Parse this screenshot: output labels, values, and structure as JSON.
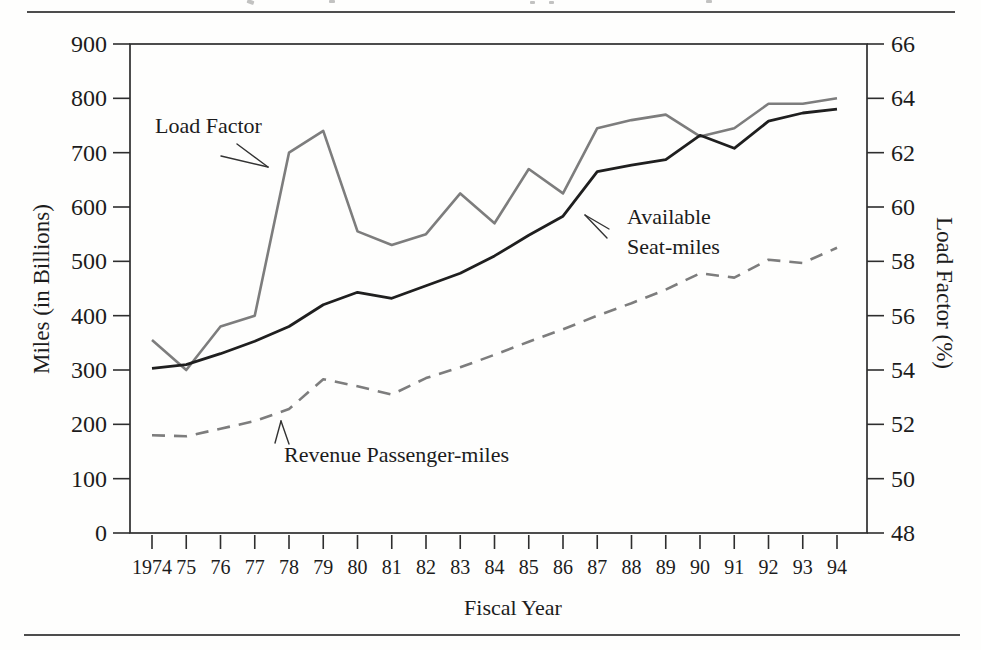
{
  "colors": {
    "gray": "#7d7d7d",
    "black": "#1f1f1f",
    "axis": "#2e2e2e",
    "text": "#1c1c1c",
    "rule": "#4d4d4d",
    "background": "#fefefd"
  },
  "chart": {
    "annotations": {
      "load_factor": "Load Factor",
      "available_seat_miles": "Available\nSeat-miles",
      "revenue_passenger_miles": "Revenue Passenger-miles"
    }
  },
  "chart_data": {
    "type": "line",
    "x_label": "Fiscal Year",
    "y_left_label": "Miles (in Billions)",
    "y_right_label": "Load Factor (%)",
    "x": [
      1974,
      1975,
      1976,
      1977,
      1978,
      1979,
      1980,
      1981,
      1982,
      1983,
      1984,
      1985,
      1986,
      1987,
      1988,
      1989,
      1990,
      1991,
      1992,
      1993,
      1994
    ],
    "x_tick_labels": [
      "1974",
      "75",
      "76",
      "77",
      "78",
      "79",
      "80",
      "81",
      "82",
      "83",
      "84",
      "85",
      "86",
      "87",
      "88",
      "89",
      "90",
      "91",
      "92",
      "93",
      "94"
    ],
    "y_left_ticks": [
      900,
      800,
      700,
      600,
      500,
      400,
      300,
      200,
      100,
      0
    ],
    "y_right_ticks": [
      66,
      64,
      62,
      60,
      58,
      56,
      54,
      52,
      50,
      48
    ],
    "ylim_left": [
      0,
      900
    ],
    "ylim_right": [
      48,
      66
    ],
    "grid": false,
    "legend": "inline annotations with arrows",
    "series": [
      {
        "name": "Load Factor",
        "axis": "right",
        "units": "%",
        "line": "solid",
        "color_key": "gray",
        "values": [
          55.1,
          54.0,
          55.6,
          56.0,
          62.0,
          62.8,
          59.1,
          58.6,
          59.0,
          60.5,
          59.4,
          61.4,
          60.5,
          62.9,
          63.2,
          63.4,
          62.6,
          62.9,
          63.8,
          63.8,
          64.0
        ]
      },
      {
        "name": "Available Seat-miles",
        "axis": "left",
        "units": "billions of miles",
        "line": "solid",
        "color_key": "black",
        "values": [
          303,
          310,
          330,
          353,
          380,
          420,
          443,
          432,
          455,
          478,
          510,
          548,
          583,
          665,
          677,
          687,
          732,
          708,
          758,
          773,
          780
        ]
      },
      {
        "name": "Revenue Passenger-miles",
        "axis": "left",
        "units": "billions of miles",
        "line": "dashed",
        "color_key": "gray",
        "values": [
          180,
          178,
          192,
          206,
          228,
          283,
          270,
          255,
          285,
          305,
          328,
          352,
          375,
          400,
          423,
          448,
          478,
          470,
          503,
          497,
          525
        ]
      }
    ]
  }
}
